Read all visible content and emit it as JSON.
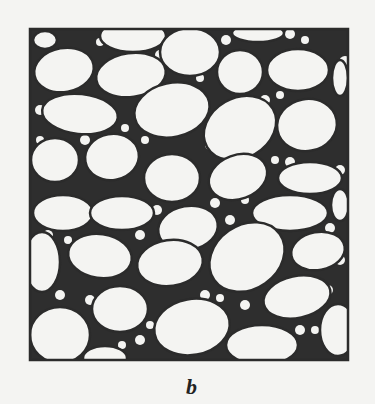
{
  "figure": {
    "label": "b",
    "colors": {
      "ink": "#2b2b2b",
      "paper": "#f4f4f2"
    }
  }
}
